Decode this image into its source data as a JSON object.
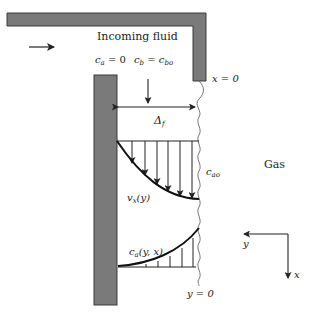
{
  "diagram": {
    "labels": {
      "incoming_fluid": "Incoming fluid",
      "ca_zero_var": "c",
      "ca_zero_sub": "a",
      "ca_zero_eq": " = 0",
      "cb_var": "c",
      "cb_sub": "b",
      "cb_eq": " = ",
      "cbo_var": "c",
      "cbo_sub": "bo",
      "x_zero": "x = 0",
      "delta_var": "Δ",
      "delta_sub": "f",
      "cao_var": "c",
      "cao_sub": "ao",
      "gas": "Gas",
      "vx_var": "v",
      "vx_sub": "x",
      "vx_arg": "(y)",
      "ca_yx_var": "c",
      "ca_yx_sub": "a",
      "ca_yx_arg": "(y, x)",
      "y_zero": "y = 0",
      "axis_y": "y",
      "axis_x": "x"
    },
    "colors": {
      "wall_fill": "#7a7a7a",
      "wall_stroke": "#3a3a3a",
      "line": "#222222",
      "interface": "#666666"
    }
  }
}
